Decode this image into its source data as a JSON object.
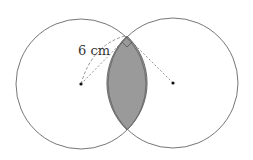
{
  "diagram": {
    "label": "6 cm",
    "left_center": [
      81,
      84
    ],
    "right_center": [
      173,
      83
    ],
    "radius": 65,
    "top_intersection": [
      127,
      36
    ],
    "bottom_intersection": [
      127,
      130
    ],
    "shade_color": "#9a9a9a",
    "line_color": "#555555"
  }
}
